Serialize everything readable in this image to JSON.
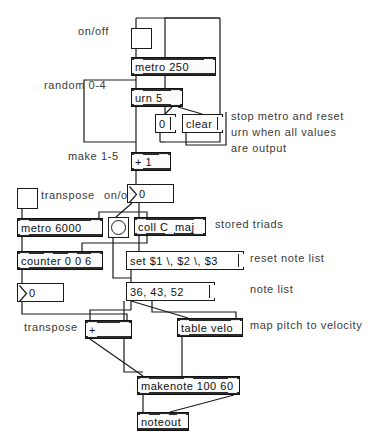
{
  "patch": {
    "title": "urn-metro-triad-patch",
    "background": "#ffffff",
    "line_color": "#1a1a1a"
  },
  "comments": [
    {
      "id": "c_onoff_top",
      "text": "on/off",
      "x": 78,
      "y": 31
    },
    {
      "id": "c_random",
      "text": "random 0-4",
      "x": 44,
      "y": 85
    },
    {
      "id": "c_stop1",
      "text": "stop metro and reset",
      "x": 231,
      "y": 116
    },
    {
      "id": "c_stop2",
      "text": "urn when all values",
      "x": 231,
      "y": 132
    },
    {
      "id": "c_stop3",
      "text": "are output",
      "x": 231,
      "y": 148
    },
    {
      "id": "c_make",
      "text": "make 1-5",
      "x": 68,
      "y": 156
    },
    {
      "id": "c_transpose1",
      "text": "transpose",
      "x": 41,
      "y": 195
    },
    {
      "id": "c_onoff_mid",
      "text": "on/off",
      "x": 104,
      "y": 195
    },
    {
      "id": "c_stored",
      "text": "stored triads",
      "x": 215,
      "y": 224
    },
    {
      "id": "c_resetnote",
      "text": "reset note list",
      "x": 250,
      "y": 258
    },
    {
      "id": "c_notelist",
      "text": "note list",
      "x": 250,
      "y": 289
    },
    {
      "id": "c_mapvel",
      "text": "map pitch to velocity",
      "x": 250,
      "y": 325
    },
    {
      "id": "c_transpose2",
      "text": "transpose",
      "x": 24,
      "y": 327
    }
  ],
  "toggles": [
    {
      "id": "tgl_metro",
      "name": "toggle-metro-onoff",
      "x": 131,
      "y": 28,
      "w": 21,
      "h": 21
    },
    {
      "id": "tgl_transpose",
      "name": "toggle-transpose-onoff",
      "x": 17,
      "y": 188,
      "w": 21,
      "h": 21
    }
  ],
  "bangs": [
    {
      "id": "bng_coll",
      "name": "bang-coll-trigger",
      "x": 108,
      "y": 217,
      "w": 21,
      "h": 21
    }
  ],
  "objects": [
    {
      "id": "o_metro250",
      "name": "object-metro-250",
      "text": "metro 250",
      "x": 131,
      "y": 57,
      "w": 85,
      "h": 19,
      "inlets": 2,
      "outlets": 1
    },
    {
      "id": "o_urn5",
      "name": "object-urn-5",
      "text": "urn 5",
      "x": 131,
      "y": 88,
      "w": 52,
      "h": 19,
      "inlets": 2,
      "outlets": 2
    },
    {
      "id": "o_plus1",
      "name": "object-plus-1",
      "text": "+ 1",
      "x": 131,
      "y": 152,
      "w": 40,
      "h": 19,
      "inlets": 2,
      "outlets": 1
    },
    {
      "id": "o_metro6000",
      "name": "object-metro-6000",
      "text": "metro 6000",
      "x": 17,
      "y": 218,
      "w": 86,
      "h": 19,
      "inlets": 2,
      "outlets": 1
    },
    {
      "id": "o_counter",
      "name": "object-counter",
      "text": "counter 0 0 6",
      "x": 17,
      "y": 251,
      "w": 86,
      "h": 19,
      "inlets": 4,
      "outlets": 1
    },
    {
      "id": "o_coll",
      "name": "object-coll-cmaj",
      "text": "coll C_maj",
      "x": 134,
      "y": 217,
      "w": 72,
      "h": 19,
      "inlets": 2,
      "outlets": 3
    },
    {
      "id": "o_tablevelo",
      "name": "object-table-velo",
      "text": "table velo",
      "x": 177,
      "y": 318,
      "w": 66,
      "h": 19,
      "inlets": 2,
      "outlets": 1
    },
    {
      "id": "o_plus",
      "name": "object-plus",
      "text": "+",
      "x": 85,
      "y": 320,
      "w": 47,
      "h": 19,
      "inlets": 2,
      "outlets": 1
    },
    {
      "id": "o_makenote",
      "name": "object-makenote",
      "text": "makenote 100 60",
      "x": 137,
      "y": 376,
      "w": 103,
      "h": 19,
      "inlets": 3,
      "outlets": 2
    },
    {
      "id": "o_noteout",
      "name": "object-noteout",
      "text": "noteout",
      "x": 137,
      "y": 412,
      "w": 52,
      "h": 19,
      "inlets": 3,
      "outlets": 0
    }
  ],
  "messages": [
    {
      "id": "m_zero",
      "name": "message-zero",
      "text": "0",
      "x": 155,
      "y": 114,
      "w": 21,
      "h": 19
    },
    {
      "id": "m_clear",
      "name": "message-clear",
      "text": "clear",
      "x": 182,
      "y": 114,
      "w": 41,
      "h": 19
    },
    {
      "id": "m_set",
      "name": "message-set-triad",
      "text": "set $1 \\, $2 \\, $3",
      "x": 126,
      "y": 251,
      "w": 118,
      "h": 19
    },
    {
      "id": "m_notes",
      "name": "message-note-list",
      "text": "36, 43, 52",
      "x": 126,
      "y": 282,
      "w": 89,
      "h": 19
    }
  ],
  "numbers": [
    {
      "id": "n_urnout",
      "name": "number-box-urn-output",
      "value": "0",
      "x": 127,
      "y": 184,
      "w": 47,
      "h": 19
    },
    {
      "id": "n_transpose",
      "name": "number-box-transpose",
      "value": "0",
      "x": 17,
      "y": 283,
      "w": 47,
      "h": 19
    }
  ]
}
